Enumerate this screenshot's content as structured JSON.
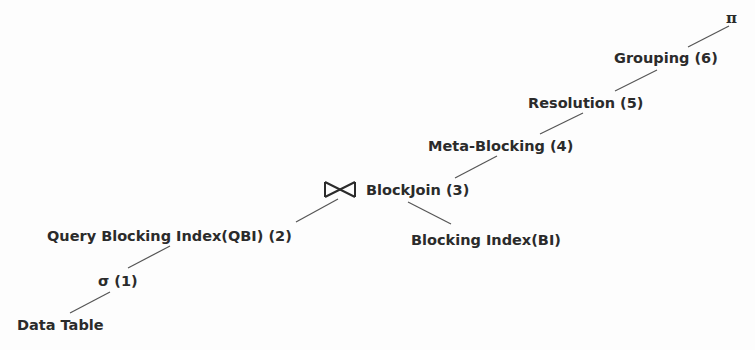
{
  "diagram": {
    "type": "query-plan-tree",
    "nodes": [
      {
        "id": "pi",
        "label": "π"
      },
      {
        "id": "grouping",
        "label": "Grouping (6)"
      },
      {
        "id": "resolution",
        "label": "Resolution (5)"
      },
      {
        "id": "metablocking",
        "label": "Meta-Blocking (4)"
      },
      {
        "id": "blockjoin",
        "label": "BlockJoin (3)",
        "icon": "bowtie-join-icon"
      },
      {
        "id": "qbi",
        "label": "Query Blocking Index(QBI) (2)"
      },
      {
        "id": "bi",
        "label": "Blocking Index(BI)"
      },
      {
        "id": "sigma",
        "label": "σ (1)"
      },
      {
        "id": "datatable",
        "label": "Data Table"
      }
    ],
    "edges": [
      [
        "pi",
        "grouping"
      ],
      [
        "grouping",
        "resolution"
      ],
      [
        "resolution",
        "metablocking"
      ],
      [
        "metablocking",
        "blockjoin"
      ],
      [
        "blockjoin",
        "qbi"
      ],
      [
        "blockjoin",
        "bi"
      ],
      [
        "qbi",
        "sigma"
      ],
      [
        "sigma",
        "datatable"
      ]
    ],
    "colors": {
      "text": "#2b2b2b",
      "edge": "#555555",
      "background": "#fdfdfd"
    }
  }
}
